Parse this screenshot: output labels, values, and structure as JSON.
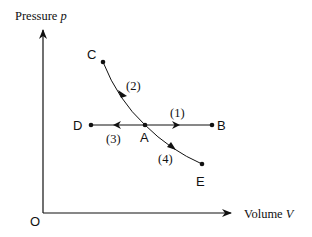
{
  "diagram": {
    "axes": {
      "y_label": "Pressure ",
      "y_var": "p",
      "x_label": "Volume ",
      "x_var": "V",
      "origin_label": "O"
    },
    "points": {
      "A": "A",
      "B": "B",
      "C": "C",
      "D": "D",
      "E": "E"
    },
    "processes": [
      {
        "label": "(1)",
        "from": "A",
        "to": "B",
        "kind": "isobaric expansion"
      },
      {
        "label": "(2)",
        "from": "A",
        "to": "C",
        "kind": "compression along curve"
      },
      {
        "label": "(3)",
        "from": "A",
        "to": "D",
        "kind": "isobaric compression"
      },
      {
        "label": "(4)",
        "from": "A",
        "to": "E",
        "kind": "expansion along curve"
      }
    ],
    "colors": {
      "line": "#111111",
      "background": "#ffffff"
    }
  }
}
